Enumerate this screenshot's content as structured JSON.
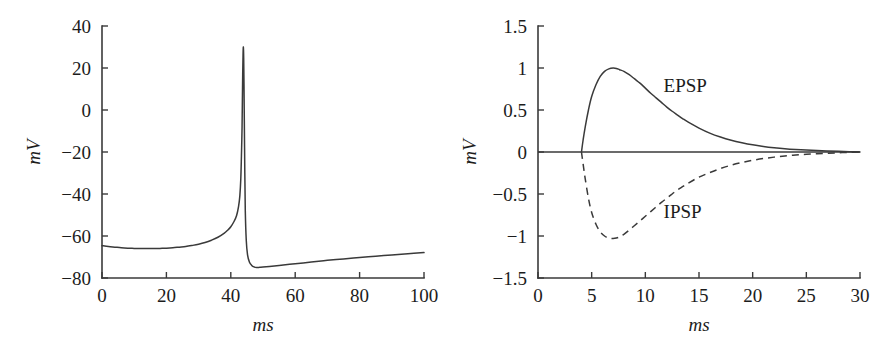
{
  "figure": {
    "panel_count": 2,
    "background_color": "#ffffff",
    "ink_color": "#3a3a3a"
  },
  "chart_data": [
    {
      "id": "action-potential",
      "type": "line",
      "title": "",
      "xlabel": "ms",
      "ylabel": "mV",
      "xlim": [
        0,
        100
      ],
      "ylim": [
        -80,
        40
      ],
      "xticks": [
        0,
        20,
        40,
        60,
        80,
        100
      ],
      "xticklabels": [
        "0",
        "20",
        "40",
        "60",
        "80",
        "100"
      ],
      "yticks": [
        -80,
        -60,
        -40,
        -20,
        0,
        20,
        40
      ],
      "yticklabels": [
        "−80",
        "−60",
        "−40",
        "−20",
        "0",
        "20",
        "40"
      ],
      "grid": false,
      "legend": "none",
      "series": [
        {
          "name": "membrane-potential",
          "style": "solid",
          "color": "#3a3a3a",
          "x": [
            0,
            2,
            4,
            6,
            8,
            10,
            12,
            14,
            16,
            18,
            20,
            22,
            24,
            26,
            28,
            30,
            32,
            34,
            36,
            38,
            39,
            40,
            41,
            41.8,
            42.4,
            42.8,
            43.1,
            43.3,
            43.5,
            43.6,
            43.7,
            43.8,
            43.9,
            44.0,
            44.1,
            44.2,
            44.35,
            44.5,
            44.8,
            45.2,
            45.8,
            46.5,
            47.2,
            48,
            49,
            50,
            52,
            55,
            60,
            65,
            70,
            75,
            80,
            85,
            90,
            95,
            100
          ],
          "y": [
            -64.6,
            -65.0,
            -65.3,
            -65.6,
            -65.8,
            -65.9,
            -66.0,
            -66.0,
            -66.0,
            -65.9,
            -65.8,
            -65.6,
            -65.3,
            -65.0,
            -64.5,
            -63.9,
            -63.1,
            -62.0,
            -60.6,
            -58.6,
            -57.3,
            -55.6,
            -53.1,
            -50.2,
            -46.0,
            -41.0,
            -33.0,
            -22.0,
            -8.0,
            5.0,
            17.0,
            26.0,
            30.0,
            25.0,
            12.0,
            -5.0,
            -30.0,
            -48.0,
            -62.0,
            -69.0,
            -72.5,
            -74.0,
            -74.7,
            -75.0,
            -74.9,
            -74.8,
            -74.5,
            -74.0,
            -73.2,
            -72.4,
            -71.6,
            -70.9,
            -70.2,
            -69.6,
            -69.0,
            -68.4,
            -67.9
          ]
        }
      ]
    },
    {
      "id": "psp-comparison",
      "type": "line",
      "title": "",
      "xlabel": "ms",
      "ylabel": "mV",
      "xlim": [
        0,
        30
      ],
      "ylim": [
        -1.5,
        1.5
      ],
      "xticks": [
        0,
        5,
        10,
        15,
        20,
        25,
        30
      ],
      "xticklabels": [
        "0",
        "5",
        "10",
        "15",
        "20",
        "25",
        "30"
      ],
      "yticks": [
        -1.5,
        -1,
        -0.5,
        0,
        0.5,
        1,
        1.5
      ],
      "yticklabels": [
        "−1.5",
        "−1",
        "−0.5",
        "0",
        "0.5",
        "1",
        "1.5"
      ],
      "grid": false,
      "zero_line": true,
      "legend": "inline-annotations",
      "series": [
        {
          "name": "EPSP",
          "style": "solid",
          "color": "#3a3a3a",
          "label": "EPSP",
          "label_x": 11.7,
          "label_y": 0.72,
          "x": [
            4.05,
            4.2,
            4.4,
            4.7,
            5.0,
            5.4,
            5.8,
            6.2,
            6.6,
            7.0,
            7.3,
            7.6,
            8.0,
            8.5,
            9.0,
            9.5,
            10.0,
            10.5,
            11.0,
            11.5,
            12.0,
            12.5,
            13.0,
            13.5,
            14.0,
            15.0,
            16.0,
            17.0,
            18.0,
            19.0,
            20.0,
            21.0,
            22.0,
            23.0,
            24.0,
            25.0,
            26.0,
            27.0,
            28.0,
            29.0,
            30.0
          ],
          "y": [
            0.0,
            0.14,
            0.3,
            0.5,
            0.66,
            0.8,
            0.9,
            0.96,
            0.99,
            1.0,
            0.995,
            0.98,
            0.96,
            0.92,
            0.87,
            0.82,
            0.76,
            0.7,
            0.645,
            0.59,
            0.535,
            0.485,
            0.44,
            0.395,
            0.355,
            0.285,
            0.225,
            0.178,
            0.14,
            0.11,
            0.085,
            0.066,
            0.051,
            0.039,
            0.03,
            0.023,
            0.017,
            0.012,
            0.008,
            0.004,
            0.0
          ]
        },
        {
          "name": "IPSP",
          "style": "dashed",
          "color": "#3a3a3a",
          "label": "IPSP",
          "label_x": 11.7,
          "label_y": -0.78,
          "x": [
            4.05,
            4.2,
            4.4,
            4.7,
            5.0,
            5.4,
            5.8,
            6.2,
            6.6,
            7.0,
            7.3,
            7.6,
            8.0,
            8.5,
            9.0,
            9.5,
            10.0,
            10.5,
            11.0,
            11.5,
            12.0,
            12.5,
            13.0,
            13.5,
            14.0,
            15.0,
            16.0,
            17.0,
            18.0,
            19.0,
            20.0,
            21.0,
            22.0,
            23.0,
            24.0,
            25.0,
            26.0,
            27.0,
            28.0,
            29.0,
            30.0
          ],
          "y": [
            0.0,
            -0.14,
            -0.32,
            -0.55,
            -0.72,
            -0.86,
            -0.95,
            -1.0,
            -1.025,
            -1.03,
            -1.025,
            -1.01,
            -0.98,
            -0.93,
            -0.875,
            -0.82,
            -0.765,
            -0.71,
            -0.655,
            -0.6,
            -0.55,
            -0.5,
            -0.45,
            -0.41,
            -0.37,
            -0.3,
            -0.245,
            -0.197,
            -0.157,
            -0.125,
            -0.099,
            -0.078,
            -0.061,
            -0.047,
            -0.036,
            -0.027,
            -0.02,
            -0.014,
            -0.009,
            -0.004,
            0.0
          ]
        }
      ]
    }
  ]
}
